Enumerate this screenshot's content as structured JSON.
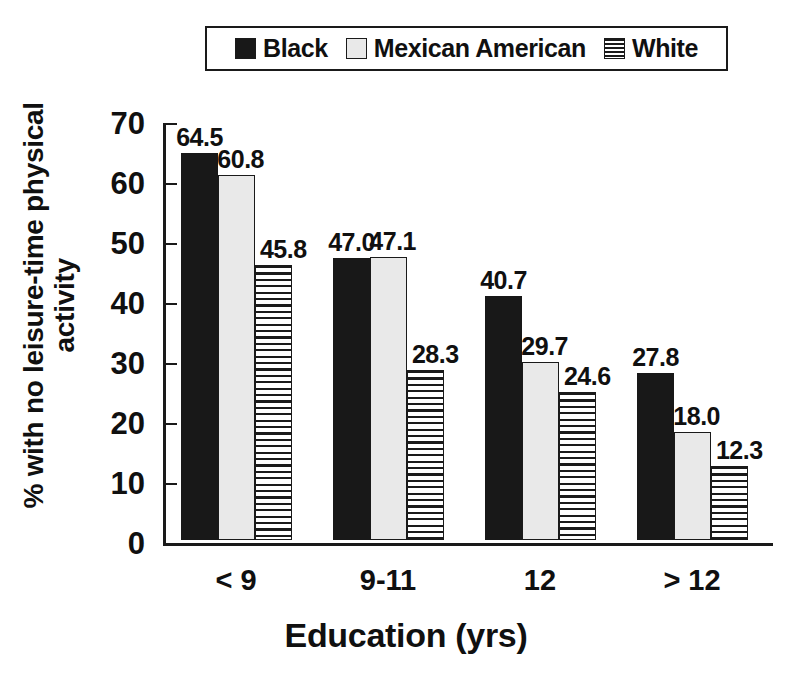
{
  "legend": {
    "entries": [
      {
        "label": "Black",
        "swatch": "solid-black-swatch-icon",
        "color": "#181818"
      },
      {
        "label": "Mexican American",
        "swatch": "light-gray-swatch-icon",
        "color": "#e9e9e9"
      },
      {
        "label": "White",
        "swatch": "horizontal-stripe-swatch-icon",
        "color": "#ffffff"
      }
    ]
  },
  "axes": {
    "x_title": "Education (yrs)",
    "y_title_line1": "% with no leisure-time physical",
    "y_title_line2": "activity",
    "y_ticks": [
      "0",
      "10",
      "20",
      "30",
      "40",
      "50",
      "60",
      "70"
    ]
  },
  "chart_data": {
    "type": "bar",
    "title": "",
    "xlabel": "Education (yrs)",
    "ylabel": "% with no leisure-time physical activity",
    "ylim": [
      0,
      70
    ],
    "ytick_values": [
      0,
      10,
      20,
      30,
      40,
      50,
      60,
      70
    ],
    "grid": false,
    "legend_position": "top-center",
    "categories": [
      "< 9",
      "9-11",
      "12",
      "> 12"
    ],
    "series": [
      {
        "name": "Black",
        "values": [
          64.5,
          47.0,
          40.7,
          27.8
        ],
        "labels": [
          "64.5",
          "47.0",
          "40.7",
          "27.8"
        ]
      },
      {
        "name": "Mexican American",
        "values": [
          60.8,
          47.1,
          29.7,
          18.0
        ],
        "labels": [
          "60.8",
          "47.1",
          "29.7",
          "18.0"
        ]
      },
      {
        "name": "White",
        "values": [
          45.8,
          28.3,
          24.6,
          12.3
        ],
        "labels": [
          "45.8",
          "28.3",
          "24.6",
          "12.3"
        ]
      }
    ]
  }
}
